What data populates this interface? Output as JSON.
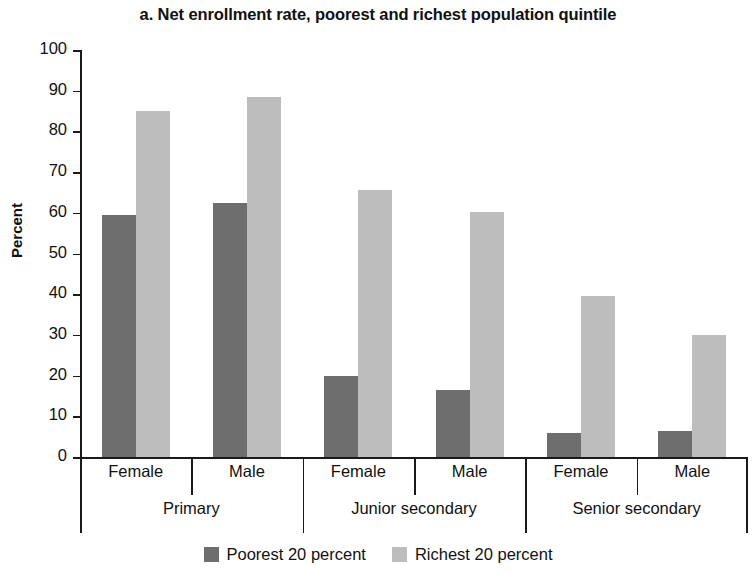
{
  "chart_data": {
    "type": "bar",
    "title": "a. Net enrollment rate, poorest and richest population quintile",
    "xlabel": "",
    "ylabel": "Percent",
    "ylim": [
      0,
      100
    ],
    "ytick_step": 10,
    "yticks": [
      100,
      90,
      80,
      70,
      60,
      50,
      40,
      30,
      20,
      10,
      0
    ],
    "grid": false,
    "legend_position": "bottom",
    "group_levels": [
      "Primary",
      "Junior secondary",
      "Senior secondary"
    ],
    "categories": [
      "Primary / Female",
      "Primary / Male",
      "Junior secondary / Female",
      "Junior secondary / Male",
      "Senior secondary / Female",
      "Senior secondary / Male"
    ],
    "sex_labels": [
      "Female",
      "Male",
      "Female",
      "Male",
      "Female",
      "Male"
    ],
    "series": [
      {
        "name": "Poorest 20 percent",
        "color": "#6e6e6e",
        "values": [
          59.5,
          62.5,
          19.8,
          16.5,
          6.0,
          6.3
        ]
      },
      {
        "name": "Richest 20 percent",
        "color": "#bdbdbd",
        "values": [
          85.0,
          88.5,
          65.5,
          60.3,
          39.5,
          30.0
        ]
      }
    ]
  },
  "axis": {
    "y_label": "Percent"
  },
  "legend": {
    "items": [
      {
        "label": "Poorest 20 percent",
        "swatch_class": "poorest"
      },
      {
        "label": "Richest 20 percent",
        "swatch_class": "richest"
      }
    ]
  }
}
